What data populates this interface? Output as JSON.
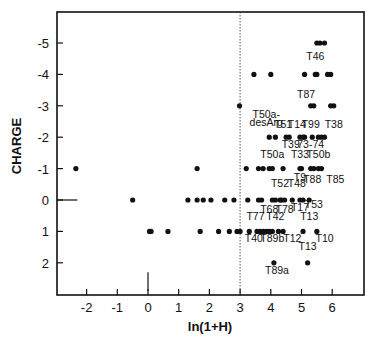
{
  "chart_data": {
    "type": "scatter",
    "title": "",
    "xlabel": "ln(1+H)",
    "ylabel": "CHARGE",
    "xlim": [
      -3,
      7
    ],
    "ylim": [
      2.9,
      -6.1
    ],
    "y_inverted": true,
    "grid": false,
    "legend": null,
    "x_ticks": [
      -2,
      -1,
      0,
      1,
      2,
      3,
      4,
      5,
      6
    ],
    "x_tick_labels": [
      "-2",
      "-1",
      "0",
      "1",
      "2",
      "3",
      "4",
      "5",
      "6"
    ],
    "y_ticks": [
      -5,
      -4,
      -3,
      -2,
      -1,
      0,
      1,
      2
    ],
    "y_tick_labels": [
      "-5",
      "-4",
      "-3",
      "-2",
      "-1",
      "0",
      "1",
      "2"
    ],
    "reference_lines": [
      {
        "orientation": "vertical",
        "x": 3,
        "style": "dotted"
      },
      {
        "orientation": "horizontal",
        "y": 0,
        "x_from": -3,
        "x_to": -2.3,
        "style": "solid"
      },
      {
        "orientation": "vertical",
        "x": 0,
        "y_from": 2.9,
        "y_to": 2.3,
        "style": "solid"
      }
    ],
    "series": [
      {
        "name": "charge -5",
        "y": -5,
        "x": [
          5.5,
          5.6,
          5.75
        ]
      },
      {
        "name": "charge -4",
        "y": -4,
        "x": [
          3.45,
          4.0,
          5.1,
          5.45,
          5.5,
          5.85,
          5.95
        ]
      },
      {
        "name": "charge -3",
        "y": -3,
        "x": [
          2.98,
          5.3,
          5.4,
          5.95,
          6.05
        ]
      },
      {
        "name": "charge -2",
        "y": -2,
        "x": [
          3.95,
          4.15,
          4.5,
          4.6,
          4.95,
          5.05,
          5.1,
          5.35,
          5.55,
          5.65,
          5.75
        ]
      },
      {
        "name": "charge -1",
        "y": -1,
        "x": [
          -2.35,
          1.6,
          3.2,
          3.6,
          3.75,
          3.95,
          4.05,
          4.4,
          4.95,
          5.0,
          5.3,
          5.4,
          5.55,
          5.65
        ]
      },
      {
        "name": "charge 0",
        "y": 0,
        "x": [
          -0.5,
          1.3,
          1.6,
          1.8,
          2.05,
          2.5,
          2.8,
          3.25,
          3.6,
          3.7,
          4.05,
          4.15,
          4.3,
          4.35,
          4.45,
          4.7,
          4.95,
          5.05,
          5.25
        ]
      },
      {
        "name": "charge 1",
        "y": 1,
        "x": [
          0.05,
          0.1,
          0.65,
          1.7,
          2.3,
          2.65,
          2.9,
          3.0,
          3.3,
          3.55,
          3.65,
          3.75,
          3.85,
          3.95,
          4.05,
          4.25,
          4.4,
          5.05,
          5.5
        ]
      },
      {
        "name": "charge 2",
        "y": 2,
        "x": [
          4.1,
          5.2
        ]
      }
    ],
    "annotations": [
      {
        "text": "T46",
        "x": 5.45,
        "y": -4,
        "label_x": 5.45,
        "label_y": -4.45
      },
      {
        "text": "T87",
        "x": 5.3,
        "y": -3,
        "label_x": 5.15,
        "label_y": -3.25
      },
      {
        "text": "T50a-",
        "x": 3.95,
        "y": -2,
        "label_x": 3.85,
        "label_y": -2.6
      },
      {
        "text": "desArg",
        "x": 3.95,
        "y": -2,
        "label_x": 3.85,
        "label_y": -2.35
      },
      {
        "text": "T51",
        "x": 4.55,
        "y": -2,
        "label_x": 4.4,
        "label_y": -2.3
      },
      {
        "text": "T14",
        "x": 4.95,
        "y": -2,
        "label_x": 4.85,
        "label_y": -2.3
      },
      {
        "text": "T99",
        "x": 5.55,
        "y": -2,
        "label_x": 5.3,
        "label_y": -2.3
      },
      {
        "text": "T38",
        "x": 5.7,
        "y": -2,
        "label_x": 6.05,
        "label_y": -2.3
      },
      {
        "text": "T39",
        "x": 4.55,
        "y": -2,
        "label_x": 4.65,
        "label_y": -1.65
      },
      {
        "text": "73-74",
        "x": 5.05,
        "y": -2,
        "label_x": 5.3,
        "label_y": -1.65
      },
      {
        "text": "T50a",
        "x": 4.05,
        "y": -1,
        "label_x": 4.05,
        "label_y": -1.35
      },
      {
        "text": "T33",
        "x": 4.95,
        "y": -1,
        "label_x": 4.95,
        "label_y": -1.35
      },
      {
        "text": "T50b",
        "x": 5.35,
        "y": -1,
        "label_x": 5.55,
        "label_y": -1.35
      },
      {
        "text": "T9",
        "x": 4.95,
        "y": -1,
        "label_x": 4.95,
        "label_y": -0.6
      },
      {
        "text": "T88",
        "x": 5.35,
        "y": -1,
        "label_x": 5.35,
        "label_y": -0.55
      },
      {
        "text": "T85",
        "x": 5.65,
        "y": -1,
        "label_x": 6.1,
        "label_y": -0.55
      },
      {
        "text": "T52",
        "x": 4.35,
        "y": 0,
        "label_x": 4.3,
        "label_y": -0.4
      },
      {
        "text": "T48",
        "x": 4.95,
        "y": 0,
        "label_x": 4.85,
        "label_y": -0.4
      },
      {
        "text": "T68",
        "x": 4.05,
        "y": 0,
        "label_x": 3.95,
        "label_y": 0.4
      },
      {
        "text": "T78",
        "x": 4.3,
        "y": 0,
        "label_x": 4.45,
        "label_y": 0.4
      },
      {
        "text": "T17",
        "x": 4.7,
        "y": 0,
        "label_x": 4.95,
        "label_y": 0.35
      },
      {
        "text": "T53",
        "x": 5.05,
        "y": 0,
        "label_x": 5.4,
        "label_y": 0.25
      },
      {
        "text": "T77",
        "x": 3.6,
        "y": 1,
        "label_x": 3.5,
        "label_y": 0.65
      },
      {
        "text": "T42",
        "x": 3.9,
        "y": 1,
        "label_x": 4.15,
        "label_y": 0.65
      },
      {
        "text": "T13",
        "x": 5.05,
        "y": 1,
        "label_x": 5.25,
        "label_y": 0.65
      },
      {
        "text": "T40",
        "x": 3.6,
        "y": 1,
        "label_x": 3.45,
        "label_y": 1.35
      },
      {
        "text": "T89b",
        "x": 3.9,
        "y": 1,
        "label_x": 4.05,
        "label_y": 1.35
      },
      {
        "text": "T12",
        "x": 4.25,
        "y": 1,
        "label_x": 4.7,
        "label_y": 1.35
      },
      {
        "text": "T10",
        "x": 5.5,
        "y": 1,
        "label_x": 5.75,
        "label_y": 1.35
      },
      {
        "text": "T13",
        "x": 5.2,
        "y": 2,
        "label_x": 5.2,
        "label_y": 1.6
      },
      {
        "text": "T89a",
        "x": 4.1,
        "y": 2,
        "label_x": 4.2,
        "label_y": 2.35
      }
    ]
  }
}
